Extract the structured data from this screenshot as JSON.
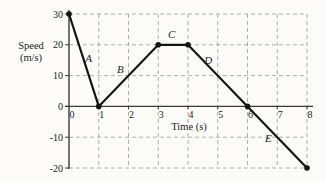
{
  "chart_data": {
    "type": "line",
    "title": "",
    "xlabel": "Time (s)",
    "ylabel_lines": [
      "Speed",
      "(m/s)"
    ],
    "xlim": [
      0,
      8
    ],
    "ylim": [
      -20,
      30
    ],
    "x_ticks": [
      0,
      1,
      2,
      3,
      4,
      5,
      6,
      7,
      8
    ],
    "y_ticks": [
      30,
      20,
      10,
      0,
      -10,
      -20
    ],
    "grid": "dashed",
    "points": [
      {
        "t": 0,
        "v": 30
      },
      {
        "t": 1,
        "v": 0
      },
      {
        "t": 3,
        "v": 20
      },
      {
        "t": 4,
        "v": 20
      },
      {
        "t": 6,
        "v": 0
      },
      {
        "t": 8,
        "v": -20
      }
    ],
    "segment_labels": [
      {
        "label": "A",
        "t": 0.66,
        "v": 15.5
      },
      {
        "label": "B",
        "t": 1.73,
        "v": 12.0
      },
      {
        "label": "C",
        "t": 3.45,
        "v": 23.5
      },
      {
        "label": "D",
        "t": 4.68,
        "v": 15.0
      },
      {
        "label": "E",
        "t": 6.7,
        "v": -10.5
      }
    ],
    "colors": {
      "line": "#141414",
      "point": "#141414",
      "grid": "#9b9b9b",
      "axis": "#3a3a3a",
      "text": "#1c1c1c",
      "background": "#fcfbf8"
    }
  }
}
